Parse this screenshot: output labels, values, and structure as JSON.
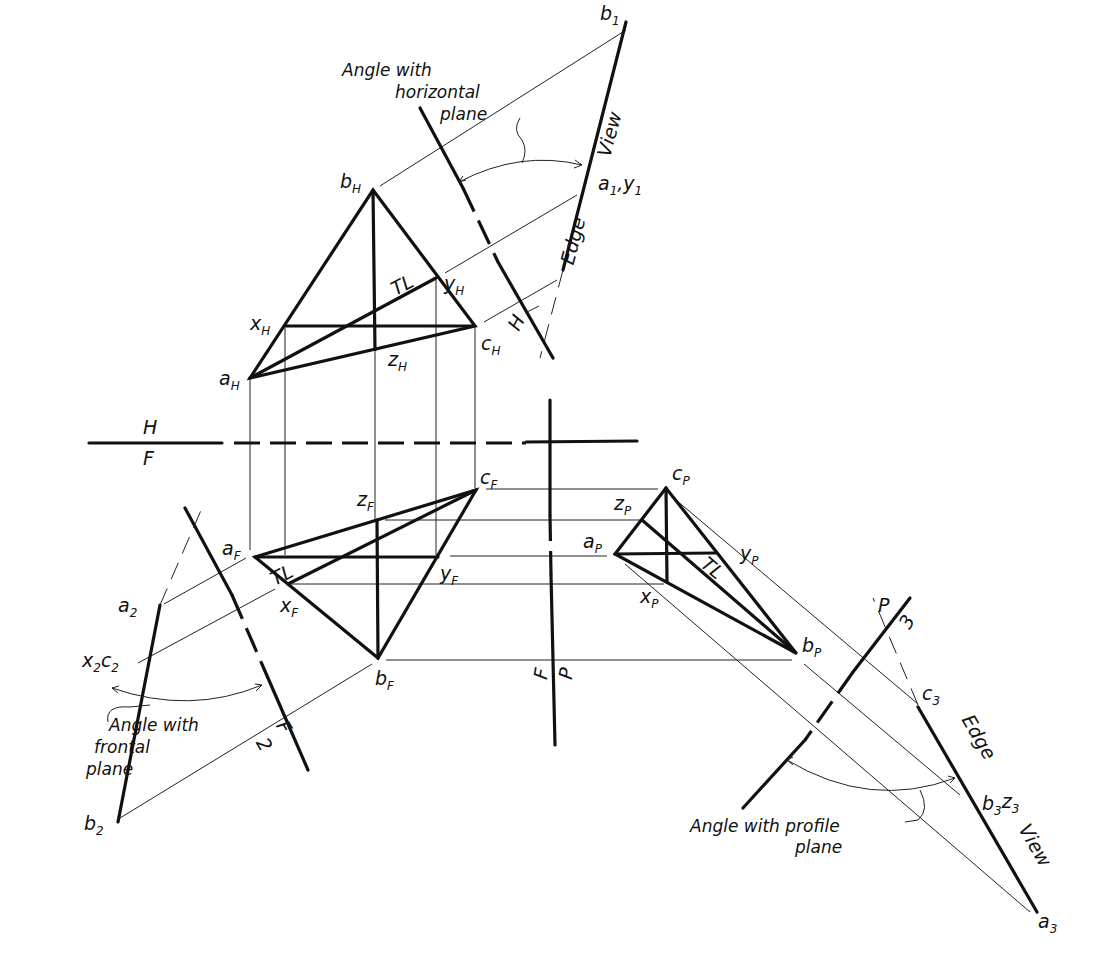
{
  "figure": {
    "fold_lines": {
      "hf": {
        "top": "H",
        "bottom": "F"
      },
      "fp": {
        "left": "F",
        "right": "P"
      },
      "h1": {
        "left": "H",
        "right": "1"
      },
      "f2": {
        "left": "F",
        "right": "2"
      },
      "p3": {
        "left": "P",
        "right": "3"
      }
    },
    "top_view": {
      "points": {
        "a": "a",
        "b": "b",
        "c": "c",
        "x": "x",
        "y": "y",
        "z": "z"
      },
      "subscript": "H",
      "tl_label": "TL"
    },
    "front_view": {
      "subscript": "F",
      "tl_label": "TL"
    },
    "profile_view": {
      "subscript": "P",
      "tl_label": "TL"
    },
    "aux1": {
      "b1": "b",
      "b1_sub": "1",
      "a1y1": "a",
      "a1y1_sub1": "1",
      "a1y1_y": "y",
      "a1y1_sub2": "1",
      "edge": "Edge",
      "view": "View",
      "angle_note": [
        "Angle with",
        "horizontal",
        "plane"
      ]
    },
    "aux2": {
      "a2": "a",
      "sub": "2",
      "x2c2_x": "x",
      "x2c2_c": "c",
      "b2": "b",
      "angle_note": [
        "Angle with",
        "frontal",
        "plane"
      ]
    },
    "aux3": {
      "c3": "c",
      "b3": "b",
      "z3": "z",
      "a3": "a",
      "sub": "3",
      "edge": "Edge",
      "view": "View",
      "angle_note": [
        "Angle with profile",
        "plane"
      ]
    }
  }
}
